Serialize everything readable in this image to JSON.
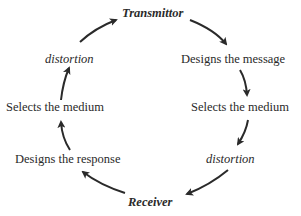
{
  "diagram": {
    "type": "communication-cycle",
    "nodes": [
      {
        "id": "transmittor",
        "label": "Transmittor",
        "style": "bold-italic"
      },
      {
        "id": "designs-message",
        "label": "Designs the message"
      },
      {
        "id": "selects-medium-right",
        "label": "Selects the medium"
      },
      {
        "id": "distortion-right",
        "label": "distortion",
        "style": "italic"
      },
      {
        "id": "receiver",
        "label": "Receiver",
        "style": "bold-italic"
      },
      {
        "id": "designs-response",
        "label": "Designs the response"
      },
      {
        "id": "selects-medium-left",
        "label": "Selects the medium"
      },
      {
        "id": "distortion-left",
        "label": "distortion",
        "style": "italic"
      }
    ],
    "edges": [
      [
        "transmittor",
        "designs-message"
      ],
      [
        "designs-message",
        "selects-medium-right"
      ],
      [
        "selects-medium-right",
        "distortion-right"
      ],
      [
        "distortion-right",
        "receiver"
      ],
      [
        "receiver",
        "designs-response"
      ],
      [
        "designs-response",
        "selects-medium-left"
      ],
      [
        "selects-medium-left",
        "distortion-left"
      ],
      [
        "distortion-left",
        "transmittor"
      ]
    ],
    "colors": {
      "text": "#2a2a2a",
      "arrow": "#2a2a2a"
    }
  }
}
